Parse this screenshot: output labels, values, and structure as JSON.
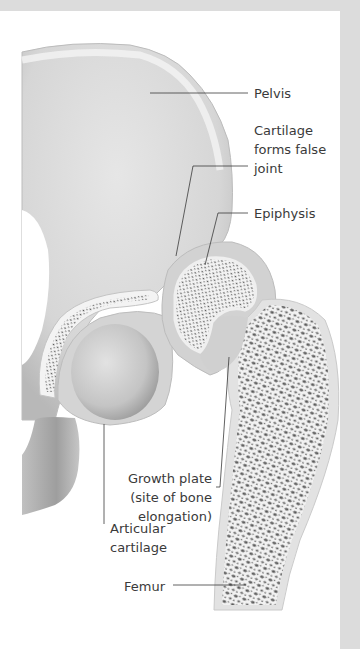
{
  "figure": {
    "colors": {
      "frame": "#dcdcdc",
      "panel": "#ffffff",
      "bone_light": "#e4e4e4",
      "bone_mid": "#c8c8c8",
      "bone_dark": "#9a9a9a",
      "cartilage": "#d2d2d2",
      "trabecular_hole": "#555555",
      "leader_line": "#3a3a3a",
      "label_text": "#3a3a3a"
    },
    "labels": {
      "pelvis": "Pelvis",
      "cartilage_false_joint": "Cartilage\nforms false\njoint",
      "epiphysis": "Epiphysis",
      "growth_plate": "Growth plate\n(site of bone\nelongation)",
      "articular_cartilage": "Articular\ncartilage",
      "femur": "Femur"
    }
  }
}
